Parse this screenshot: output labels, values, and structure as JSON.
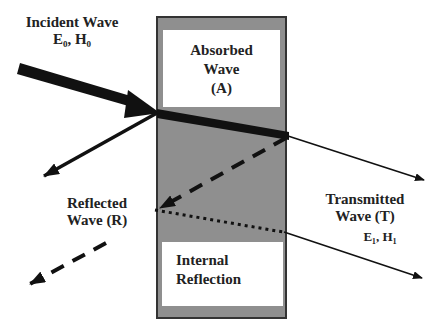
{
  "diagram": {
    "colors": {
      "slab_fill": "#8f8f8f",
      "slab_border": "#333333",
      "panel_fill": "#ffffff",
      "arrow": "#111111",
      "text": "#222222"
    },
    "labels": {
      "incident_title": "Incident Wave",
      "incident_fields": "E₀, H₀",
      "absorbed_line1": "Absorbed",
      "absorbed_line2": "Wave",
      "absorbed_line3": "(A)",
      "reflected_line1": "Reflected",
      "reflected_line2": "Wave (R)",
      "transmitted_line1": "Transmitted",
      "transmitted_line2": "Wave (T)",
      "transmitted_fields": "E₁, H₁",
      "internal_line1": "Internal",
      "internal_line2": "Reflection"
    }
  }
}
